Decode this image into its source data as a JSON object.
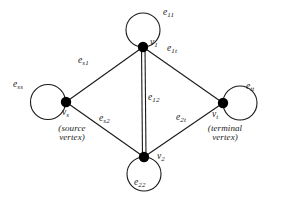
{
  "figure": {
    "type": "undirected-multigraph-with-loops",
    "stroke_color": "#1a1a1a",
    "vertex_fill_color": "#000000",
    "background_color": "#ffffff"
  },
  "vertices": [
    {
      "id": "vs",
      "label_base": "v",
      "label_sub": "s",
      "caption_line1": "(source",
      "caption_line2": "vertex)",
      "loop_label_base": "e",
      "loop_label_sub": "ss",
      "x": 66,
      "y": 102
    },
    {
      "id": "v1",
      "label_base": "v",
      "label_sub": "1",
      "caption_line1": "",
      "caption_line2": "",
      "loop_label_base": "e",
      "loop_label_sub": "11",
      "x": 143,
      "y": 47
    },
    {
      "id": "v2",
      "label_base": "v",
      "label_sub": "2",
      "caption_line1": "",
      "caption_line2": "",
      "loop_label_base": "e",
      "loop_label_sub": "22",
      "x": 144,
      "y": 157
    },
    {
      "id": "vt",
      "label_base": "v",
      "label_sub": "t",
      "caption_line1": "(terminal",
      "caption_line2": "vertex)",
      "loop_label_base": "e",
      "loop_label_sub": "tt",
      "x": 223,
      "y": 103
    }
  ],
  "edges": [
    {
      "id": "es1",
      "from": "vs",
      "to": "v1",
      "label_base": "e",
      "label_sub": "s1"
    },
    {
      "id": "es2",
      "from": "vs",
      "to": "v2",
      "label_base": "e",
      "label_sub": "s2"
    },
    {
      "id": "e1t",
      "from": "v1",
      "to": "vt",
      "label_base": "e",
      "label_sub": "1t"
    },
    {
      "id": "e2t",
      "from": "v2",
      "to": "vt",
      "label_base": "e",
      "label_sub": "2t"
    },
    {
      "id": "e12",
      "from": "v1",
      "to": "v2",
      "label_base": "e",
      "label_sub": "12"
    }
  ],
  "labels": {
    "e11": {
      "base": "e",
      "sub": "11",
      "x": 163,
      "y": 8
    },
    "e1t": {
      "base": "e",
      "sub": "1t",
      "x": 167,
      "y": 44
    },
    "v1": {
      "base": "v",
      "sub": "1",
      "x": 150,
      "y": 38
    },
    "ess": {
      "base": "e",
      "sub": "ss",
      "x": 13,
      "y": 80
    },
    "es1": {
      "base": "e",
      "sub": "s1",
      "x": 78,
      "y": 56
    },
    "vs": {
      "base": "v",
      "sub": "s",
      "x": 62,
      "y": 108
    },
    "source_caption": {
      "line1": "(source",
      "line2": "vertex)",
      "x": 42,
      "y": 124
    },
    "es2": {
      "base": "e",
      "sub": "s2",
      "x": 99,
      "y": 114
    },
    "e12": {
      "base": "e",
      "sub": "12",
      "x": 148,
      "y": 93
    },
    "e22": {
      "base": "e",
      "sub": "22",
      "x": 134,
      "y": 178
    },
    "v2": {
      "base": "v",
      "sub": "2",
      "x": 157,
      "y": 152
    },
    "e2t": {
      "base": "e",
      "sub": "2t",
      "x": 176,
      "y": 113
    },
    "vt": {
      "base": "v",
      "sub": "t",
      "x": 212,
      "y": 110
    },
    "ett": {
      "base": "e",
      "sub": "tt",
      "x": 246,
      "y": 82
    },
    "terminal_caption": {
      "line1": "(terminal",
      "line2": "vertex)",
      "x": 196,
      "y": 124
    }
  }
}
